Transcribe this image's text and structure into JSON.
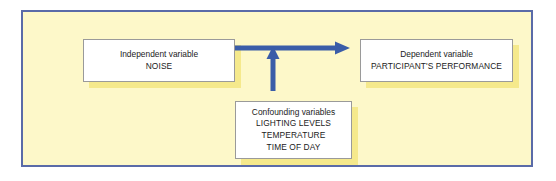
{
  "diagram": {
    "frame": {
      "border_color": "#5a6ba8",
      "background_color": "#fdf8c9"
    },
    "arrow_color": "#3a5da8",
    "box": {
      "fill_color": "#ffffff",
      "border_color": "#9a9a9a",
      "shadow_color": "#f5e98c"
    },
    "nodes": [
      {
        "id": "independent",
        "title": "Independent variable",
        "value": "NOISE"
      },
      {
        "id": "dependent",
        "title": "Dependent variable",
        "value": "PARTICIPANT'S PERFORMANCE"
      },
      {
        "id": "confounding",
        "title": "Confounding variables",
        "value_1": "LIGHTING LEVELS",
        "value_2": "TEMPERATURE",
        "value_3": "TIME OF DAY"
      }
    ],
    "arrows": [
      {
        "id": "independent-to-dependent",
        "from": "independent",
        "to": "dependent",
        "direction": "right"
      },
      {
        "id": "confounding-to-relationship",
        "from": "confounding",
        "to": "independent-to-dependent",
        "direction": "up"
      }
    ]
  }
}
